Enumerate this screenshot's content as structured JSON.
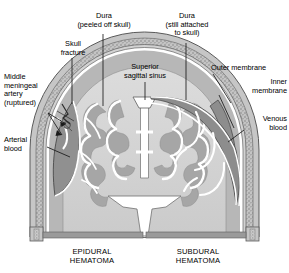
{
  "figure": {
    "type": "medical-illustration",
    "background_color": "#ffffff"
  },
  "labels": {
    "dura_peeled": "Dura\n(peeled off skull)",
    "dura_attached": "Dura\n(still attached\nto skull)",
    "skull_fracture": "Skull\nfracture",
    "superior_sagittal_sinus": "Superior\nsagittal sinus",
    "outer_membrane": "Outer membrane",
    "inner_membrane": "Inner\nmembrane",
    "middle_meningeal_artery": "Middle\nmeningeal\nartery\n(ruptured)",
    "arterial_blood": "Arterial\nblood",
    "venous_blood": "Venous\nblood"
  },
  "captions": {
    "left": "EPIDURAL\nHEMATOMA",
    "right": "SUBDURAL\nHEMATOMA"
  },
  "colors": {
    "background": "#ffffff",
    "text": "#000000",
    "leader_line": "#1a1a1a",
    "skull_outer": "#b9b9b9",
    "skull_stipple": "#8d8d8d",
    "skull_inner_table": "#cfcfcf",
    "dura": "#ffffff",
    "hematoma_blood": "#8f8f8f",
    "brain_white_matter": "#d5d5d5",
    "brain_gray_matter": "#a8a8a8",
    "ventricle": "#ffffff",
    "subarachnoid": "#c2c2c2",
    "vessel_stroke": "#ffffff",
    "scalp": "#c8c8c8"
  },
  "anatomy_parts": [
    "scalp",
    "skull (diploe, stippled)",
    "dura mater",
    "epidural hematoma (lens-shaped, left)",
    "subdural hematoma (crescent, right)",
    "superior sagittal sinus",
    "falx cerebri",
    "cerebral cortex (gray matter)",
    "white matter",
    "lateral ventricles",
    "third ventricle",
    "bridging veins",
    "middle meningeal artery"
  ]
}
